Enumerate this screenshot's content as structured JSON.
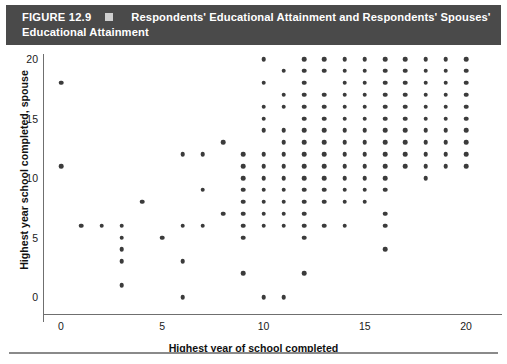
{
  "header": {
    "figure_number": "FIGURE 12.9",
    "marker_icon": "filled-square-icon",
    "title_line1": "Respondents' Educational Attainment and Respondents' Spouses'",
    "title_line2": "Educational Attainment",
    "background_color": "#4a4a4a",
    "text_color": "#ffffff"
  },
  "chart_data": {
    "type": "scatter",
    "title": "Respondents' Educational Attainment and Respondents' Spouses' Educational Attainment",
    "xlabel": "Highest year of school completed",
    "ylabel": "Highest year school completed, spouse",
    "xlim": [
      -1,
      21.2
    ],
    "ylim": [
      -1.2,
      21.5
    ],
    "xticks": [
      0,
      5,
      10,
      15,
      20
    ],
    "yticks": [
      0,
      5,
      10,
      15,
      20
    ],
    "xtick_labels": [
      "0",
      "5",
      "10",
      "15",
      "20"
    ],
    "ytick_labels": [
      "0",
      "5",
      "10",
      "15",
      "20"
    ],
    "grid": false,
    "legend": false,
    "marker_color": "#3b3b3b",
    "marker_size": 4.6,
    "points": [
      [
        0,
        18
      ],
      [
        0,
        11
      ],
      [
        1,
        6
      ],
      [
        2,
        6
      ],
      [
        3,
        6
      ],
      [
        3,
        5
      ],
      [
        3,
        4
      ],
      [
        3,
        3
      ],
      [
        3,
        1
      ],
      [
        4,
        8
      ],
      [
        5,
        5
      ],
      [
        6,
        12
      ],
      [
        6,
        6
      ],
      [
        6,
        3
      ],
      [
        6,
        0
      ],
      [
        7,
        12
      ],
      [
        7,
        9
      ],
      [
        7,
        6
      ],
      [
        8,
        13
      ],
      [
        8,
        7
      ],
      [
        9,
        12
      ],
      [
        9,
        11
      ],
      [
        9,
        10
      ],
      [
        9,
        9
      ],
      [
        9,
        8
      ],
      [
        9,
        7
      ],
      [
        9,
        6
      ],
      [
        9,
        5
      ],
      [
        9,
        2
      ],
      [
        10,
        20
      ],
      [
        10,
        18
      ],
      [
        10,
        16
      ],
      [
        10,
        15
      ],
      [
        10,
        14
      ],
      [
        10,
        12
      ],
      [
        10,
        11
      ],
      [
        10,
        10
      ],
      [
        10,
        9
      ],
      [
        10,
        8
      ],
      [
        10,
        7
      ],
      [
        10,
        6
      ],
      [
        10,
        0
      ],
      [
        11,
        19
      ],
      [
        11,
        17
      ],
      [
        11,
        16
      ],
      [
        11,
        14
      ],
      [
        11,
        13
      ],
      [
        11,
        12
      ],
      [
        11,
        11
      ],
      [
        11,
        10
      ],
      [
        11,
        9
      ],
      [
        11,
        8
      ],
      [
        11,
        7
      ],
      [
        11,
        6
      ],
      [
        11,
        0
      ],
      [
        12,
        20
      ],
      [
        12,
        19
      ],
      [
        12,
        18
      ],
      [
        12,
        17
      ],
      [
        12,
        16
      ],
      [
        12,
        15
      ],
      [
        12,
        14
      ],
      [
        12,
        13
      ],
      [
        12,
        12
      ],
      [
        12,
        11
      ],
      [
        12,
        10
      ],
      [
        12,
        9
      ],
      [
        12,
        8
      ],
      [
        12,
        7
      ],
      [
        12,
        6
      ],
      [
        12,
        5
      ],
      [
        12,
        2
      ],
      [
        13,
        20
      ],
      [
        13,
        19
      ],
      [
        13,
        17
      ],
      [
        13,
        16
      ],
      [
        13,
        15
      ],
      [
        13,
        14
      ],
      [
        13,
        13
      ],
      [
        13,
        12
      ],
      [
        13,
        11
      ],
      [
        13,
        10
      ],
      [
        13,
        9
      ],
      [
        13,
        8
      ],
      [
        13,
        6
      ],
      [
        14,
        20
      ],
      [
        14,
        19
      ],
      [
        14,
        18
      ],
      [
        14,
        17
      ],
      [
        14,
        16
      ],
      [
        14,
        15
      ],
      [
        14,
        14
      ],
      [
        14,
        13
      ],
      [
        14,
        12
      ],
      [
        14,
        11
      ],
      [
        14,
        10
      ],
      [
        14,
        9
      ],
      [
        14,
        8
      ],
      [
        14,
        6
      ],
      [
        15,
        20
      ],
      [
        15,
        19
      ],
      [
        15,
        18
      ],
      [
        15,
        17
      ],
      [
        15,
        16
      ],
      [
        15,
        15
      ],
      [
        15,
        14
      ],
      [
        15,
        13
      ],
      [
        15,
        12
      ],
      [
        15,
        11
      ],
      [
        15,
        10
      ],
      [
        15,
        9
      ],
      [
        15,
        8
      ],
      [
        16,
        20
      ],
      [
        16,
        19
      ],
      [
        16,
        18
      ],
      [
        16,
        17
      ],
      [
        16,
        16
      ],
      [
        16,
        15
      ],
      [
        16,
        14
      ],
      [
        16,
        13
      ],
      [
        16,
        12
      ],
      [
        16,
        11
      ],
      [
        16,
        10
      ],
      [
        16,
        9
      ],
      [
        16,
        7
      ],
      [
        16,
        6
      ],
      [
        16,
        4
      ],
      [
        17,
        20
      ],
      [
        17,
        19
      ],
      [
        17,
        18
      ],
      [
        17,
        17
      ],
      [
        17,
        16
      ],
      [
        17,
        15
      ],
      [
        17,
        14
      ],
      [
        17,
        13
      ],
      [
        17,
        12
      ],
      [
        17,
        11
      ],
      [
        18,
        20
      ],
      [
        18,
        19
      ],
      [
        18,
        18
      ],
      [
        18,
        17
      ],
      [
        18,
        16
      ],
      [
        18,
        15
      ],
      [
        18,
        14
      ],
      [
        18,
        13
      ],
      [
        18,
        12
      ],
      [
        18,
        11
      ],
      [
        18,
        10
      ],
      [
        19,
        20
      ],
      [
        19,
        19
      ],
      [
        19,
        18
      ],
      [
        19,
        17
      ],
      [
        19,
        16
      ],
      [
        19,
        15
      ],
      [
        19,
        14
      ],
      [
        19,
        13
      ],
      [
        19,
        12
      ],
      [
        19,
        11
      ],
      [
        20,
        20
      ],
      [
        20,
        19
      ],
      [
        20,
        18
      ],
      [
        20,
        17
      ],
      [
        20,
        16
      ],
      [
        20,
        15
      ],
      [
        20,
        14
      ],
      [
        20,
        13
      ],
      [
        20,
        12
      ],
      [
        20,
        11
      ]
    ]
  }
}
